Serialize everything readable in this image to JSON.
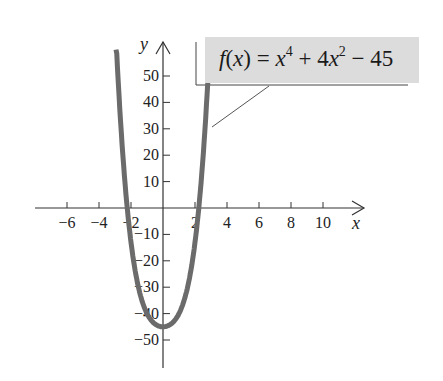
{
  "chart_data": {
    "type": "line",
    "title": "",
    "function_label": {
      "f": "f",
      "x": "x",
      "eq": " = ",
      "term1_base": "x",
      "term1_exp": "4",
      "plus": " + 4",
      "term2_base": "x",
      "term2_exp": "2",
      "minus": " − 45"
    },
    "expression": "f(x) = x^4 + 4x^2 - 45",
    "xlabel": "x",
    "ylabel": "y",
    "x_ticks": [
      -6,
      -4,
      -2,
      2,
      4,
      6,
      8,
      10
    ],
    "x_tick_labels": [
      "−6",
      "−4",
      "−2",
      "2",
      "4",
      "6",
      "8",
      "10"
    ],
    "y_ticks": [
      50,
      40,
      30,
      20,
      10,
      -10,
      -20,
      -30,
      -40,
      -50
    ],
    "y_tick_labels": [
      "50",
      "40",
      "30",
      "20",
      "10",
      "−10",
      "−20",
      "−30",
      "−40",
      "−50"
    ],
    "xlim": [
      -8,
      12.5
    ],
    "ylim": [
      -60,
      63
    ],
    "grid": false,
    "series": [
      {
        "name": "f(x)",
        "color": "#6b6b6b",
        "x": [
          -2.94,
          -2.5,
          -2,
          -1.5,
          -1,
          -0.5,
          0,
          0.5,
          1,
          1.5,
          2,
          2.5,
          2.81
        ],
        "y": [
          64,
          19.1,
          -13,
          -30.9,
          -40,
          -43.9,
          -45,
          -43.9,
          -40,
          -30.9,
          -13,
          19.1,
          42
        ]
      }
    ]
  }
}
